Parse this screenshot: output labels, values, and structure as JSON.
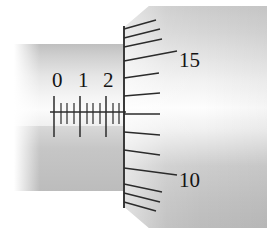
{
  "figure": {
    "kind": "micrometer-scale-reading"
  },
  "sleeve": {
    "name": "sleeve-scale",
    "orientation": "horizontal",
    "baseline_y": 112,
    "labels": [
      {
        "text": "0",
        "x": 52,
        "y": 70
      },
      {
        "text": "1",
        "x": 78,
        "y": 70
      },
      {
        "text": "2",
        "x": 103,
        "y": 70
      }
    ],
    "major_ticks_x": [
      54,
      80,
      106
    ],
    "minor_ticks_x": [
      61,
      67,
      74,
      87,
      93,
      100,
      113,
      119
    ],
    "major_up_len": 16,
    "major_down_len": 25,
    "minor_up_len": 0,
    "minor_down_len": 12
  },
  "thimble": {
    "name": "thimble-scale",
    "orientation": "vertical",
    "edge_x": 124,
    "labels": [
      {
        "text": "15",
        "x": 179,
        "y": 50
      },
      {
        "text": "10",
        "x": 179,
        "y": 170
      }
    ],
    "ticks": [
      {
        "y": 29,
        "len": 32,
        "slope": -9,
        "kind": "short"
      },
      {
        "y": 38,
        "len": 36,
        "slope": -9,
        "kind": "short"
      },
      {
        "y": 47,
        "len": 38,
        "slope": -8,
        "kind": "short"
      },
      {
        "y": 61,
        "len": 53,
        "slope": -10,
        "kind": "long"
      },
      {
        "y": 78,
        "len": 35,
        "slope": -5,
        "kind": "short"
      },
      {
        "y": 96,
        "len": 36,
        "slope": -3,
        "kind": "short"
      },
      {
        "y": 114,
        "len": 36,
        "slope": 0,
        "kind": "short"
      },
      {
        "y": 132,
        "len": 36,
        "slope": 3,
        "kind": "short"
      },
      {
        "y": 150,
        "len": 36,
        "slope": 5,
        "kind": "short"
      },
      {
        "y": 168,
        "len": 53,
        "slope": 7,
        "kind": "long"
      },
      {
        "y": 184,
        "len": 38,
        "slope": 8,
        "kind": "short"
      },
      {
        "y": 193,
        "len": 36,
        "slope": 9,
        "kind": "short"
      },
      {
        "y": 202,
        "len": 32,
        "slope": 9,
        "kind": "short"
      }
    ]
  },
  "colors": {
    "ink": "#141414",
    "tick": "#2b2b2b",
    "metal_light": "#f4f4f4",
    "metal_mid": "#cfcfcf",
    "metal_dark": "#bcbcbc",
    "background": "#ffffff"
  }
}
